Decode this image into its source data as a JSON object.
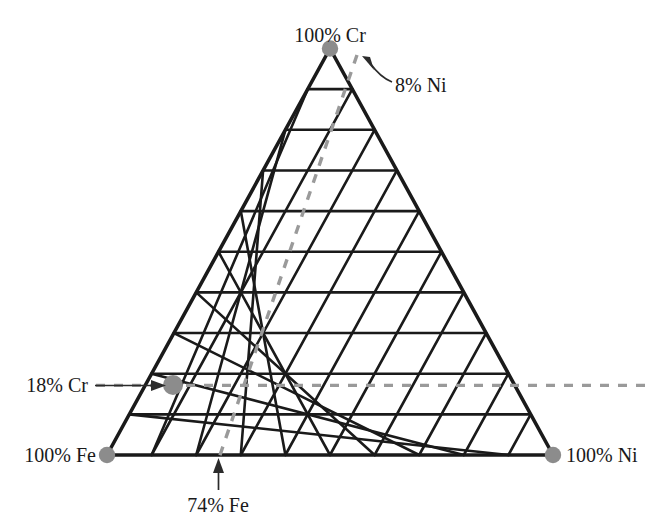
{
  "figure": {
    "type": "ternary-composition-diagram",
    "system": "Fe-Cr-Ni",
    "grid_divisions": 10
  },
  "vertices": {
    "top": {
      "label": "100% Cr",
      "component": "Cr",
      "value": 100,
      "unit": "%"
    },
    "bottom_left": {
      "label": "100% Fe",
      "component": "Fe",
      "value": 100,
      "unit": "%"
    },
    "bottom_right": {
      "label": "100% Ni",
      "component": "Ni",
      "value": 100,
      "unit": "%"
    }
  },
  "annotations": {
    "cr_line": {
      "label": "18% Cr",
      "component": "Cr",
      "value": 18,
      "unit": "%"
    },
    "ni_line": {
      "label": "8% Ni",
      "component": "Ni",
      "value": 8,
      "unit": "%"
    },
    "fe_line": {
      "label": "74% Fe",
      "component": "Fe",
      "value": 74,
      "unit": "%"
    }
  },
  "marked_point": {
    "composition": {
      "Fe": 74,
      "Cr": 18,
      "Ni": 8
    }
  },
  "colors": {
    "line": "#1a1a1a",
    "dashed": "#9a9a9a",
    "dot": "#8c8c8c",
    "text": "#1a1a1a",
    "background": "#ffffff"
  },
  "chart_data": {
    "type": "scatter",
    "title": "",
    "xlabel": "",
    "ylabel": "",
    "ternary_axes": [
      "Fe",
      "Cr",
      "Ni"
    ],
    "axis_ranges": {
      "Fe": [
        0,
        100
      ],
      "Cr": [
        0,
        100
      ],
      "Ni": [
        0,
        100
      ]
    },
    "grid": true,
    "grid_step": 10,
    "legend": "none",
    "corner_labels": [
      "100% Cr",
      "100% Fe",
      "100% Ni"
    ],
    "points": [
      {
        "label": "",
        "Fe": 74,
        "Cr": 18,
        "Ni": 8
      }
    ],
    "guide_lines": [
      {
        "label": "18% Cr",
        "component": "Cr",
        "value": 18,
        "style": "dashed",
        "orientation": "horizontal"
      },
      {
        "label": "8% Ni",
        "component": "Ni",
        "value": 8,
        "style": "dashed",
        "orientation": "diagonal"
      },
      {
        "label": "74% Fe",
        "component": "Fe",
        "value": 74,
        "style": "arrow",
        "orientation": "vertical"
      }
    ]
  }
}
